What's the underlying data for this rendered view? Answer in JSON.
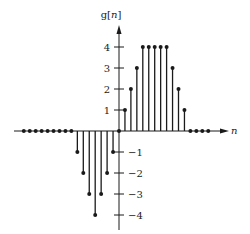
{
  "chart_data": {
    "type": "stem",
    "title": "",
    "ylabel": "g[n]",
    "xlabel": "n",
    "x": [
      -16,
      -15,
      -14,
      -13,
      -12,
      -11,
      -10,
      -9,
      -8,
      -7,
      -6,
      -5,
      -4,
      -3,
      -2,
      -1,
      0,
      1,
      2,
      3,
      4,
      5,
      6,
      7,
      8,
      9,
      10,
      11,
      12,
      13,
      14,
      15
    ],
    "values": [
      0,
      0,
      0,
      0,
      0,
      0,
      0,
      0,
      0,
      -1,
      -2,
      -3,
      -4,
      -3,
      -2,
      -1,
      0,
      1,
      2,
      3,
      4,
      4,
      4,
      4,
      4,
      3,
      2,
      1,
      0,
      0,
      0,
      0
    ],
    "y_ticks": [
      4,
      3,
      2,
      1,
      -1,
      -2,
      -3,
      -4
    ],
    "y_tick_labels": [
      "4",
      "3",
      "2",
      "1",
      "−1",
      "−2",
      "−3",
      "−4"
    ],
    "ylim": [
      -4.5,
      4.8
    ],
    "grid": false,
    "legend": null
  },
  "labels": {
    "y_axis_prefix": "g[",
    "y_axis_var": "n",
    "y_axis_suffix": "]",
    "x_axis": "n"
  },
  "colors": {
    "ink": "#1a1a1a",
    "background": "#ffffff"
  }
}
